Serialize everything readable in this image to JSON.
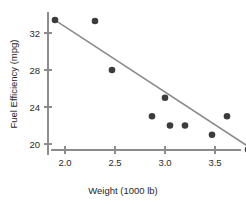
{
  "chart_data": {
    "type": "scatter",
    "title": "",
    "xlabel": "Weight (1000 lb)",
    "ylabel": "Fuel Efficiency (mpg)",
    "xlim": [
      1.78,
      3.98
    ],
    "ylim": [
      18.6,
      34.2
    ],
    "xticks": [
      2.0,
      2.5,
      3.0,
      3.5
    ],
    "xtick_labels": [
      "2.0",
      "2.5",
      "3.0",
      "3.5"
    ],
    "yticks": [
      20,
      24,
      28,
      32
    ],
    "ytick_labels": [
      "20",
      "24",
      "28",
      "32"
    ],
    "grid": false,
    "legend": null,
    "point_color": "#3c3c3c",
    "line_color": "#8a8a8a",
    "axis_color": "#8c8c8c",
    "points": [
      {
        "x": 1.9,
        "y": 33.4
      },
      {
        "x": 2.3,
        "y": 33.3
      },
      {
        "x": 2.47,
        "y": 28.0
      },
      {
        "x": 3.0,
        "y": 25.0
      },
      {
        "x": 2.87,
        "y": 23.0
      },
      {
        "x": 3.05,
        "y": 22.0
      },
      {
        "x": 3.2,
        "y": 22.0
      },
      {
        "x": 3.62,
        "y": 23.0
      },
      {
        "x": 3.47,
        "y": 21.0
      },
      {
        "x": 3.83,
        "y": 19.4
      },
      {
        "x": 3.9,
        "y": 19.4
      }
    ],
    "series": [
      {
        "name": "Fuel Efficiency vs Weight",
        "x": [
          1.9,
          2.3,
          2.47,
          3.0,
          2.87,
          3.05,
          3.2,
          3.62,
          3.47,
          3.83,
          3.9
        ],
        "values": [
          33.4,
          33.3,
          28.0,
          25.0,
          23.0,
          22.0,
          22.0,
          23.0,
          21.0,
          19.4,
          19.4
        ]
      }
    ],
    "fit_line": {
      "type": "linear-regression",
      "x_start": 1.9,
      "y_start": 33.4,
      "x_end": 3.95,
      "y_end": 18.9
    }
  }
}
